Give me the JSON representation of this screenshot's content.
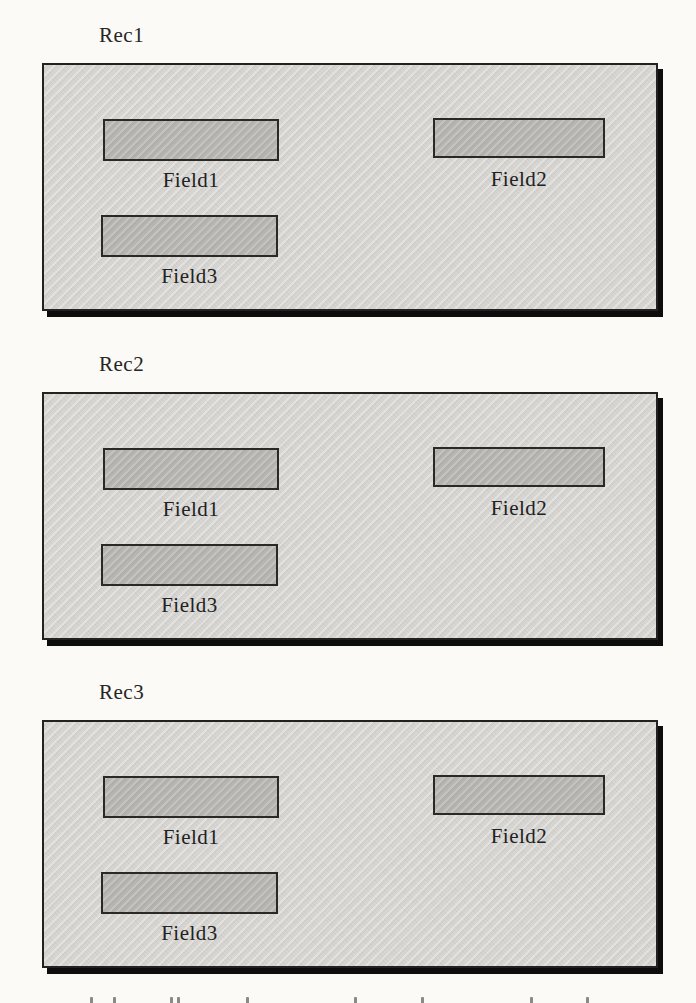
{
  "palette": {
    "paper": "#fbfaf6",
    "record_fill": "#d7d6d2",
    "field_fill": "#b6b5b1",
    "border": "#232220",
    "shadow": "#0d0d0d",
    "text": "#22211f"
  },
  "records": [
    {
      "label": "Rec1",
      "fields": [
        {
          "label": "Field1"
        },
        {
          "label": "Field2"
        },
        {
          "label": "Field3"
        }
      ]
    },
    {
      "label": "Rec2",
      "fields": [
        {
          "label": "Field1"
        },
        {
          "label": "Field2"
        },
        {
          "label": "Field3"
        }
      ]
    },
    {
      "label": "Rec3",
      "fields": [
        {
          "label": "Field1"
        },
        {
          "label": "Field2"
        },
        {
          "label": "Field3"
        }
      ]
    }
  ]
}
